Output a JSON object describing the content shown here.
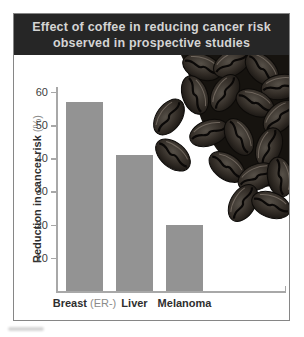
{
  "figure": {
    "title_line1": "Effect of coffee in reducing cancer risk",
    "title_line2": "observed in prospective studies",
    "colors": {
      "title_background": "#262626",
      "title_text": "#d4d4d4",
      "bar": "#939393",
      "axis": "#a8a8a8",
      "tick_text": "#404040",
      "label_text": "#2e2e2e",
      "label_parenthetical": "#8b8b8b",
      "frame_border": "#868686",
      "coffee_bean_dark": "#16130f"
    },
    "decor": {
      "photo": "coffee-beans-cluster"
    }
  },
  "chart_data": {
    "type": "bar",
    "title": "Effect of coffee in reducing cancer risk observed in prospective studies",
    "categories": [
      "Breast (ER-)",
      "Liver",
      "Melanoma"
    ],
    "values": [
      57,
      41,
      20
    ],
    "xlabel": "",
    "ylabel": "Reduction in cancer risk (%)",
    "ylim": [
      0,
      62
    ],
    "yticks": [
      10,
      20,
      30,
      40,
      50,
      60
    ],
    "grid": false,
    "legend": "none",
    "bar_color": "#939393"
  }
}
